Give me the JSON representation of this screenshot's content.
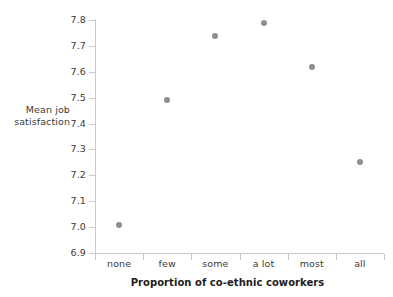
{
  "chart_data": {
    "type": "scatter",
    "title": "",
    "categories": [
      "none",
      "few",
      "some",
      "a lot",
      "most",
      "all"
    ],
    "values": [
      7.01,
      7.49,
      7.74,
      7.79,
      7.62,
      7.25
    ],
    "series": [
      {
        "name": "Mean job satisfaction",
        "values": [
          7.01,
          7.49,
          7.74,
          7.79,
          7.62,
          7.25
        ]
      }
    ],
    "xlabel": "Proportion of co-ethnic coworkers",
    "ylabel": "Mean job satisfaction",
    "ylabel_lines": [
      "Mean job",
      "satisfaction"
    ],
    "ylim": [
      6.9,
      7.8
    ],
    "yticks": [
      7.8,
      7.7,
      7.6,
      7.5,
      7.4,
      7.3,
      7.2,
      7.1,
      7.0,
      6.9
    ],
    "ytick_labels": [
      "7.8",
      "7.7",
      "7.6",
      "7.5",
      "7.4",
      "7.3",
      "7.2",
      "7.1",
      "7.0",
      "6.9"
    ],
    "grid": false,
    "legend": null,
    "marker_color": "#8e8e8e",
    "axis_color": "#c9c9c9",
    "text_color": "#3b3b3b",
    "title_color": "#1d1d1d",
    "background": "#ffffff"
  }
}
